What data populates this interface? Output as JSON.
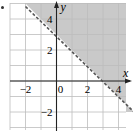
{
  "chart_data": {
    "type": "inequality-graph",
    "title": "",
    "xlabel": "x",
    "ylabel": "y",
    "xlim": [
      -3.5,
      4.9
    ],
    "ylim": [
      -3.2,
      5.2
    ],
    "grid": true,
    "x_ticks": [
      -2,
      0,
      2,
      4
    ],
    "y_ticks": [
      -2,
      2,
      4
    ],
    "x_tick_labels": [
      "−2",
      "0",
      "2",
      "4"
    ],
    "y_tick_labels": [
      "−2",
      "2",
      "4"
    ],
    "boundary": {
      "equation": "y = -x + 3",
      "style": "dashed",
      "points": [
        [
          -2,
          5
        ],
        [
          0,
          3
        ],
        [
          3,
          0
        ],
        [
          5,
          -2
        ]
      ]
    },
    "inequality": "y > -x + 3",
    "shaded_region": "above",
    "colors": {
      "shade": "#c9c9c9",
      "grid": "#bdbdbd",
      "axis": "#222222",
      "boundary": "#555555"
    }
  }
}
